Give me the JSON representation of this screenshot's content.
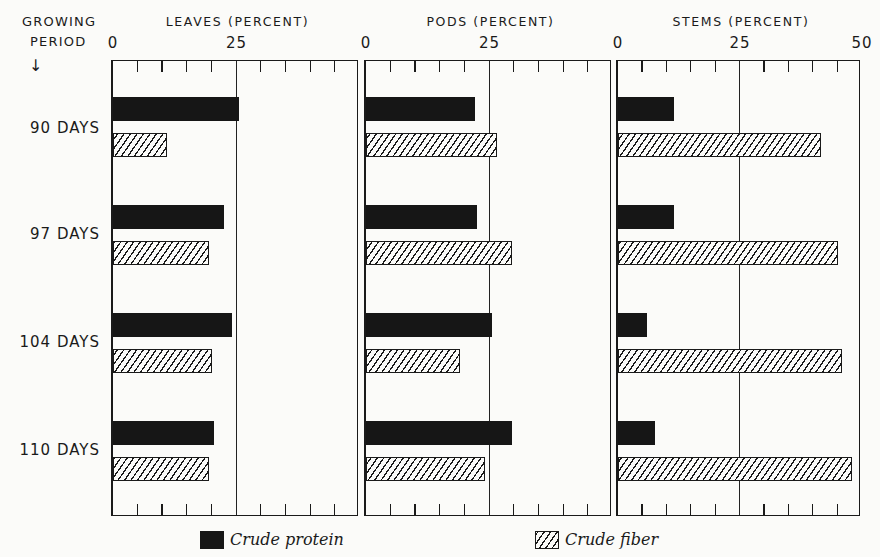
{
  "axis": {
    "row_header_line1": "GROWING",
    "row_header_line2": "PERIOD",
    "arrow": "↓"
  },
  "panels": [
    {
      "title": "LEAVES (PERCENT)",
      "ticks": [
        "0",
        "25"
      ],
      "left": 111,
      "width": 247,
      "max": 50
    },
    {
      "title": "PODS (PERCENT)",
      "ticks": [
        "0",
        "25"
      ],
      "left": 364,
      "width": 247,
      "max": 50
    },
    {
      "title": "STEMS (PERCENT)",
      "ticks": [
        "0",
        "25",
        "50"
      ],
      "left": 616,
      "width": 244,
      "max": 50
    }
  ],
  "rows": [
    {
      "label": "90 DAYS"
    },
    {
      "label": "97 DAYS"
    },
    {
      "label": "104 DAYS"
    },
    {
      "label": "110 DAYS"
    }
  ],
  "legend": {
    "protein": "Crude protein",
    "fiber": "Crude fiber"
  },
  "colors": {
    "protein": "#161616",
    "ink": "#1a1a1a",
    "paper": "#fbfbf9"
  },
  "chart_data": {
    "type": "bar",
    "orientation": "horizontal",
    "title": "",
    "categories": [
      "90 DAYS",
      "97 DAYS",
      "104 DAYS",
      "110 DAYS"
    ],
    "category_axis_label": "GROWING PERIOD",
    "legend": [
      "Crude protein",
      "Crude fiber"
    ],
    "legend_position": "bottom",
    "grid": false,
    "panels": [
      {
        "name": "LEAVES (PERCENT)",
        "xlim": [
          0,
          50
        ],
        "tick_labels": [
          "0",
          "25"
        ],
        "series": [
          {
            "name": "Crude protein",
            "values": [
              25.5,
              22.5,
              24.0,
              20.5
            ]
          },
          {
            "name": "Crude fiber",
            "values": [
              11.0,
              19.5,
              20.0,
              19.5
            ]
          }
        ]
      },
      {
        "name": "PODS (PERCENT)",
        "xlim": [
          0,
          50
        ],
        "tick_labels": [
          "0",
          "25"
        ],
        "series": [
          {
            "name": "Crude protein",
            "values": [
              22.0,
              22.5,
              25.5,
              29.5
            ]
          },
          {
            "name": "Crude fiber",
            "values": [
              26.5,
              29.5,
              19.0,
              24.0
            ]
          }
        ]
      },
      {
        "name": "STEMS (PERCENT)",
        "xlim": [
          0,
          50
        ],
        "tick_labels": [
          "0",
          "25",
          "50"
        ],
        "series": [
          {
            "name": "Crude protein",
            "values": [
              11.5,
              11.5,
              6.0,
              7.5
            ]
          },
          {
            "name": "Crude fiber",
            "values": [
              41.5,
              45.0,
              46.0,
              48.0
            ]
          }
        ]
      }
    ]
  }
}
